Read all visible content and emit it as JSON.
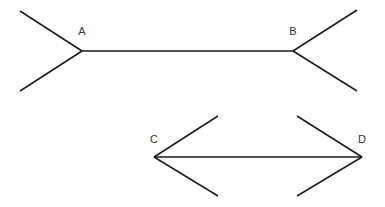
{
  "figure": {
    "background_color": "#ffffff",
    "line_color": "#1a1a1a",
    "label_color": "#333333",
    "width": 385,
    "height": 207
  },
  "labels": {
    "a": "A",
    "b": "B",
    "c": "C",
    "d": "D"
  },
  "shapes": {
    "top_figure": {
      "name": "fins-outward-segment",
      "shaft": {
        "x1": 82,
        "y1": 51,
        "x2": 293,
        "y2": 51
      },
      "fins": [
        {
          "name": "fin-a-upper",
          "x1": 82,
          "y1": 51,
          "x2": 20,
          "y2": 11
        },
        {
          "name": "fin-a-lower",
          "x1": 82,
          "y1": 51,
          "x2": 20,
          "y2": 91
        },
        {
          "name": "fin-b-upper",
          "x1": 293,
          "y1": 51,
          "x2": 357,
          "y2": 10
        },
        {
          "name": "fin-b-lower",
          "x1": 293,
          "y1": 51,
          "x2": 357,
          "y2": 91
        }
      ],
      "label_points": [
        {
          "key": "a",
          "x": 82,
          "y": 35
        },
        {
          "key": "b",
          "x": 293,
          "y": 35
        }
      ]
    },
    "bottom_figure": {
      "name": "fins-inward-segment",
      "shaft": {
        "x1": 154,
        "y1": 157,
        "x2": 362,
        "y2": 157
      },
      "fins": [
        {
          "name": "fin-c-upper",
          "x1": 154,
          "y1": 157,
          "x2": 218,
          "y2": 116
        },
        {
          "name": "fin-c-lower",
          "x1": 154,
          "y1": 157,
          "x2": 218,
          "y2": 196
        },
        {
          "name": "fin-d-upper",
          "x1": 362,
          "y1": 157,
          "x2": 297,
          "y2": 116
        },
        {
          "name": "fin-d-lower",
          "x1": 362,
          "y1": 157,
          "x2": 297,
          "y2": 196
        }
      ],
      "label_points": [
        {
          "key": "c",
          "x": 154,
          "y": 143
        },
        {
          "key": "d",
          "x": 362,
          "y": 143
        }
      ]
    }
  }
}
